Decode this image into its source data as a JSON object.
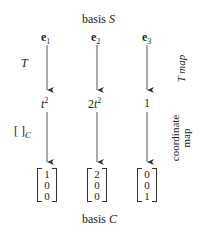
{
  "top_title": {
    "prefix": "basis ",
    "var": "S"
  },
  "bottom_title": {
    "prefix": "basis ",
    "var": "C"
  },
  "columns": [
    {
      "vector": "e",
      "index": "1",
      "image_text": "t",
      "image_coef": "",
      "image_exp": "2",
      "coords": [
        "1",
        "0",
        "0"
      ]
    },
    {
      "vector": "e",
      "index": "2",
      "image_text": "t",
      "image_coef": "2",
      "image_exp": "2",
      "coords": [
        "2",
        "0",
        "0"
      ]
    },
    {
      "vector": "e",
      "index": "3",
      "image_text": "1",
      "image_coef": "",
      "image_exp": "",
      "coords": [
        "0",
        "0",
        "1"
      ]
    }
  ],
  "left_labels": {
    "map": "T",
    "coord_map": "[ ]",
    "coord_sub": "C"
  },
  "right_labels": {
    "t_map": "T map",
    "coord_line1": "coordinate",
    "coord_line2": "map"
  },
  "colors": {
    "arrow": "#333333",
    "text": "#222222"
  }
}
